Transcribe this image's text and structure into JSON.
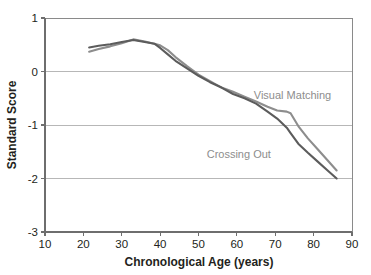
{
  "chart_data": {
    "type": "line",
    "title": "",
    "xlabel": "Chronological Age (years)",
    "ylabel": "Standard Score",
    "xlim": [
      10,
      90
    ],
    "ylim": [
      -3,
      1
    ],
    "xticks": [
      10,
      20,
      30,
      40,
      50,
      60,
      70,
      80,
      90
    ],
    "xtick_labels": [
      "10",
      "20",
      "30",
      "40",
      "50",
      "60",
      "70",
      "80",
      "90"
    ],
    "yticks": [
      1,
      0,
      -1,
      -2,
      -3
    ],
    "ytick_labels": [
      "1",
      "0",
      "-1",
      "-2",
      "-3"
    ],
    "grid": "horizontal",
    "legend_position": "inline-annotation",
    "series": [
      {
        "name": "Visual Matching",
        "color": "#8d8d8d",
        "label_x": 74.5,
        "label_y": -0.52,
        "x": [
          21.5,
          24,
          27,
          30,
          33,
          36,
          38.5,
          40,
          42,
          44,
          47,
          50,
          53,
          56,
          59,
          62,
          65,
          68,
          70.5,
          73,
          74,
          76,
          78.5,
          81,
          83.5,
          86
        ],
        "y": [
          0.37,
          0.42,
          0.47,
          0.53,
          0.6,
          0.56,
          0.52,
          0.49,
          0.4,
          0.27,
          0.1,
          -0.06,
          -0.18,
          -0.3,
          -0.38,
          -0.47,
          -0.56,
          -0.66,
          -0.73,
          -0.75,
          -0.78,
          -1.02,
          -1.25,
          -1.45,
          -1.65,
          -1.85
        ]
      },
      {
        "name": "Crossing Out",
        "color": "#5c5c5c",
        "label_x": 60.5,
        "label_y": -1.62,
        "x": [
          21.5,
          24,
          27,
          30,
          33,
          36,
          38.5,
          40,
          42,
          44,
          47,
          50,
          53,
          56,
          59,
          62,
          65,
          68,
          70.5,
          73,
          74,
          76,
          78.5,
          81,
          83.5,
          86
        ],
        "y": [
          0.45,
          0.48,
          0.51,
          0.55,
          0.59,
          0.55,
          0.52,
          0.44,
          0.32,
          0.2,
          0.06,
          -0.08,
          -0.2,
          -0.3,
          -0.42,
          -0.5,
          -0.6,
          -0.75,
          -0.88,
          -1.05,
          -1.15,
          -1.35,
          -1.52,
          -1.68,
          -1.84,
          -2.0
        ]
      }
    ]
  },
  "axes": {
    "x_title": "Chronological Age (years)",
    "y_title": "Standard Score"
  },
  "colors": {
    "visual_matching": "#8d8d8d",
    "crossing_out": "#5c5c5c",
    "gridline": "#b7b7b7",
    "axis": "#6e6e6e",
    "text": "#231f20",
    "background": "#ffffff"
  }
}
